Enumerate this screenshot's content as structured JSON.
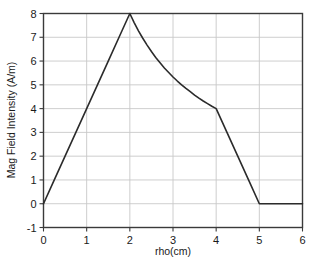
{
  "chart_data": {
    "type": "line",
    "title": "",
    "xlabel": "rho(cm)",
    "ylabel": "Mag Field Intensity (A/m)",
    "xlim": [
      0,
      6
    ],
    "ylim": [
      -1,
      8
    ],
    "xticks": [
      "0",
      "1",
      "2",
      "3",
      "4",
      "5",
      "6"
    ],
    "yticks": [
      "-1",
      "0",
      "1",
      "2",
      "3",
      "4",
      "5",
      "6",
      "7",
      "8"
    ],
    "xtick_values": [
      0,
      1,
      2,
      3,
      4,
      5,
      6
    ],
    "ytick_values": [
      -1,
      0,
      1,
      2,
      3,
      4,
      5,
      6,
      7,
      8
    ],
    "grid": true,
    "grid_color": "#c8c8c8",
    "legend": "none",
    "line_color": "#2b2b2b",
    "line_width": 1.6,
    "frame_color": "#3a3a3a",
    "background": "#ffffff",
    "series": [
      {
        "name": "Mag Field Intensity",
        "x": [
          0,
          0.25,
          0.5,
          0.75,
          1,
          1.25,
          1.5,
          1.75,
          2,
          2.1,
          2.2,
          2.3,
          2.4,
          2.5,
          2.6,
          2.7,
          2.8,
          2.9,
          3,
          3.1,
          3.2,
          3.3,
          3.4,
          3.5,
          3.6,
          3.7,
          3.8,
          3.9,
          4,
          4.25,
          4.5,
          4.75,
          5,
          5.25,
          5.5,
          5.75,
          6
        ],
        "y": [
          0,
          1,
          2,
          3,
          4,
          5,
          6,
          7,
          8,
          7.62,
          7.27,
          6.96,
          6.67,
          6.4,
          6.15,
          5.93,
          5.71,
          5.52,
          5.33,
          5.16,
          5,
          4.85,
          4.71,
          4.57,
          4.44,
          4.32,
          4.21,
          4.1,
          4,
          3,
          2,
          1,
          0,
          0,
          0,
          0,
          0
        ]
      }
    ],
    "annotations": [
      {
        "label": "peak",
        "x": 2,
        "y": 8
      },
      {
        "label": "kink",
        "x": 4,
        "y": 4
      },
      {
        "label": "zero-crossing",
        "x": 5,
        "y": 0
      }
    ]
  }
}
